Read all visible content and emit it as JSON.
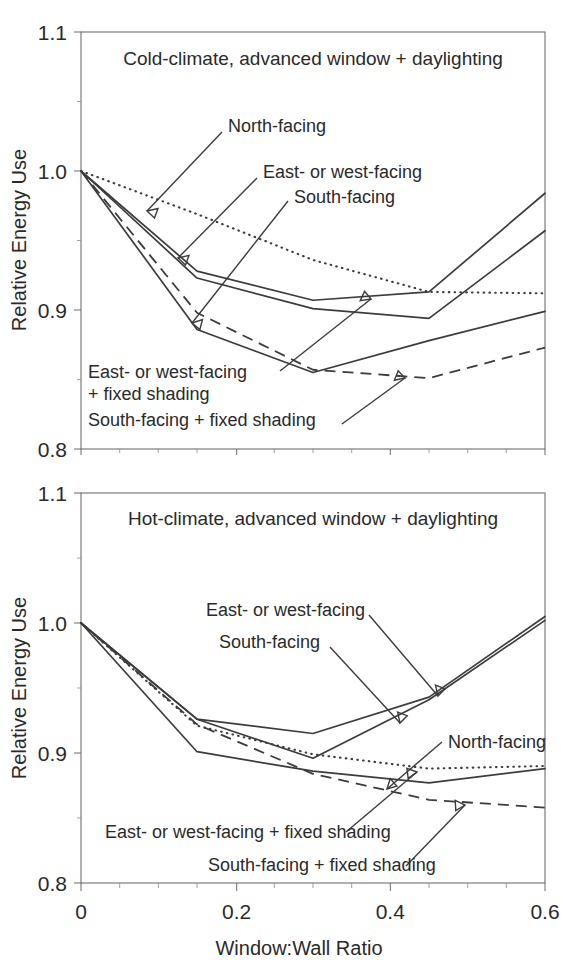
{
  "figure": {
    "xlabel": "Window:Wall Ratio",
    "ylabel": "Relative Energy Use",
    "x_ticks": [
      "0",
      "0.2",
      "0.4",
      "0.6"
    ],
    "y_ticks": [
      "1.1",
      "1.0",
      "0.9",
      "0.8"
    ]
  },
  "panels": {
    "top": {
      "title": "Cold-climate, advanced window + daylighting"
    },
    "bottom": {
      "title": "Hot-climate, advanced window + daylighting"
    }
  },
  "annotations": {
    "north": "North-facing",
    "eastwest": "East- or west-facing",
    "south": "South-facing",
    "eastwest_shade_l1": "East- or west-facing",
    "eastwest_shade_l2": "+ fixed shading",
    "south_shade": "South-facing + fixed shading",
    "eastwest_shade_inline": "East- or west-facing + fixed shading"
  },
  "chart_data": [
    {
      "type": "line",
      "title": "Cold-climate, advanced window + daylighting",
      "xlabel": "Window:Wall Ratio",
      "ylabel": "Relative Energy Use",
      "xlim": [
        0,
        0.6
      ],
      "ylim": [
        0.8,
        1.1
      ],
      "xticks": [
        0,
        0.2,
        0.4,
        0.6
      ],
      "yticks": [
        0.8,
        0.9,
        1.0,
        1.1
      ],
      "grid": false,
      "legend": "annotated-inline",
      "series": [
        {
          "name": "North-facing",
          "style": "dotted",
          "x": [
            0,
            0.15,
            0.3,
            0.45,
            0.6
          ],
          "y": [
            1.0,
            0.969,
            0.936,
            0.913,
            0.912
          ]
        },
        {
          "name": "East- or west-facing",
          "style": "solid",
          "x": [
            0,
            0.15,
            0.3,
            0.45,
            0.6
          ],
          "y": [
            1.0,
            0.928,
            0.907,
            0.913,
            0.984
          ]
        },
        {
          "name": "South-facing",
          "style": "solid",
          "x": [
            0,
            0.15,
            0.3,
            0.45,
            0.6
          ],
          "y": [
            1.0,
            0.923,
            0.901,
            0.894,
            0.957
          ]
        },
        {
          "name": "East- or west-facing + fixed shading",
          "style": "solid",
          "x": [
            0,
            0.15,
            0.3,
            0.45,
            0.6
          ],
          "y": [
            1.0,
            0.886,
            0.855,
            0.878,
            0.899
          ]
        },
        {
          "name": "South-facing + fixed shading",
          "style": "dashed",
          "x": [
            0,
            0.15,
            0.3,
            0.45,
            0.6
          ],
          "y": [
            1.0,
            0.898,
            0.857,
            0.851,
            0.873
          ]
        }
      ]
    },
    {
      "type": "line",
      "title": "Hot-climate, advanced window + daylighting",
      "xlabel": "Window:Wall Ratio",
      "ylabel": "Relative Energy Use",
      "xlim": [
        0,
        0.6
      ],
      "ylim": [
        0.8,
        1.1
      ],
      "xticks": [
        0,
        0.2,
        0.4,
        0.6
      ],
      "yticks": [
        0.8,
        0.9,
        1.0,
        1.1
      ],
      "grid": false,
      "legend": "annotated-inline",
      "series": [
        {
          "name": "East- or west-facing",
          "style": "solid",
          "x": [
            0,
            0.15,
            0.3,
            0.45,
            0.6
          ],
          "y": [
            1.0,
            0.926,
            0.915,
            0.943,
            1.005
          ]
        },
        {
          "name": "South-facing",
          "style": "solid",
          "x": [
            0,
            0.15,
            0.3,
            0.45,
            0.6
          ],
          "y": [
            1.0,
            0.926,
            0.896,
            0.941,
            1.002
          ]
        },
        {
          "name": "North-facing",
          "style": "dotted",
          "x": [
            0,
            0.15,
            0.3,
            0.45,
            0.6
          ],
          "y": [
            1.0,
            0.921,
            0.899,
            0.888,
            0.89
          ]
        },
        {
          "name": "East- or west-facing + fixed shading",
          "style": "solid",
          "x": [
            0,
            0.15,
            0.3,
            0.45,
            0.6
          ],
          "y": [
            1.0,
            0.901,
            0.886,
            0.877,
            0.888
          ]
        },
        {
          "name": "South-facing + fixed shading",
          "style": "dashed",
          "x": [
            0,
            0.15,
            0.3,
            0.45,
            0.6
          ],
          "y": [
            1.0,
            0.922,
            0.884,
            0.864,
            0.858
          ]
        }
      ]
    }
  ]
}
